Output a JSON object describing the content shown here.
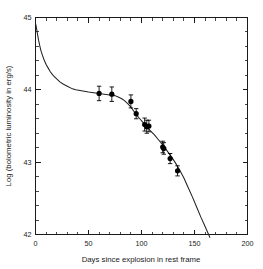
{
  "chart_data": {
    "type": "scatter",
    "title": "",
    "xlabel": "Days since explosion in rest frame",
    "ylabel": "Log (bolometric luminosity in erg/s)",
    "xlim": [
      0,
      200
    ],
    "ylim": [
      42,
      45
    ],
    "xticks": [
      0,
      50,
      100,
      150,
      200
    ],
    "yticks": [
      42,
      43,
      44,
      45
    ],
    "xtick_labels": [
      "0",
      "50",
      "100",
      "150",
      "200"
    ],
    "ytick_labels": [
      "42",
      "43",
      "44",
      "45"
    ],
    "x_minor_step": 10,
    "y_minor_step": 0.2,
    "grid": false,
    "legend": null,
    "series": [
      {
        "name": "Observed bolometric luminosity",
        "marker": "filled-circle",
        "color": "#000000",
        "points": [
          {
            "x": 60,
            "y": 43.95,
            "yerr": 0.1
          },
          {
            "x": 72,
            "y": 43.94,
            "yerr": 0.1
          },
          {
            "x": 90,
            "y": 43.84,
            "yerr": 0.09
          },
          {
            "x": 95,
            "y": 43.67,
            "yerr": 0.07
          },
          {
            "x": 103,
            "y": 43.52,
            "yerr": 0.09
          },
          {
            "x": 105,
            "y": 43.49,
            "yerr": 0.09
          },
          {
            "x": 107,
            "y": 43.5,
            "yerr": 0.08
          },
          {
            "x": 120,
            "y": 43.21,
            "yerr": 0.08
          },
          {
            "x": 121,
            "y": 43.19,
            "yerr": 0.08
          },
          {
            "x": 127,
            "y": 43.05,
            "yerr": 0.07
          },
          {
            "x": 134,
            "y": 42.88,
            "yerr": 0.07
          }
        ]
      },
      {
        "name": "Model light curve",
        "marker": "none",
        "color": "#222222",
        "curve": [
          {
            "x": 0.0,
            "y": 44.92
          },
          {
            "x": 0.6,
            "y": 44.88
          },
          {
            "x": 1.2,
            "y": 44.83
          },
          {
            "x": 2.0,
            "y": 44.76
          },
          {
            "x": 3.0,
            "y": 44.68
          },
          {
            "x": 4.0,
            "y": 44.61
          },
          {
            "x": 5.0,
            "y": 44.55
          },
          {
            "x": 6.5,
            "y": 44.48
          },
          {
            "x": 8.0,
            "y": 44.42
          },
          {
            "x": 10.0,
            "y": 44.35
          },
          {
            "x": 12.0,
            "y": 44.3
          },
          {
            "x": 14.0,
            "y": 44.25
          },
          {
            "x": 16.0,
            "y": 44.21
          },
          {
            "x": 18.0,
            "y": 44.18
          },
          {
            "x": 20.0,
            "y": 44.15
          },
          {
            "x": 23.0,
            "y": 44.11
          },
          {
            "x": 26.0,
            "y": 44.08
          },
          {
            "x": 30.0,
            "y": 44.05
          },
          {
            "x": 34.0,
            "y": 44.02
          },
          {
            "x": 38.0,
            "y": 44.0
          },
          {
            "x": 42.0,
            "y": 43.99
          },
          {
            "x": 46.0,
            "y": 43.98
          },
          {
            "x": 50.0,
            "y": 43.97
          },
          {
            "x": 55.0,
            "y": 43.96
          },
          {
            "x": 60.0,
            "y": 43.95
          },
          {
            "x": 65.0,
            "y": 43.94
          },
          {
            "x": 70.0,
            "y": 43.93
          },
          {
            "x": 75.0,
            "y": 43.92
          },
          {
            "x": 78.0,
            "y": 43.9
          },
          {
            "x": 81.0,
            "y": 43.88
          },
          {
            "x": 84.0,
            "y": 43.85
          },
          {
            "x": 87.0,
            "y": 43.81
          },
          {
            "x": 90.0,
            "y": 43.76
          },
          {
            "x": 93.0,
            "y": 43.7
          },
          {
            "x": 96.0,
            "y": 43.64
          },
          {
            "x": 99.0,
            "y": 43.59
          },
          {
            "x": 102.0,
            "y": 43.54
          },
          {
            "x": 105.0,
            "y": 43.49
          },
          {
            "x": 108.0,
            "y": 43.44
          },
          {
            "x": 112.0,
            "y": 43.38
          },
          {
            "x": 116.0,
            "y": 43.31
          },
          {
            "x": 120.0,
            "y": 43.24
          },
          {
            "x": 124.0,
            "y": 43.16
          },
          {
            "x": 128.0,
            "y": 43.08
          },
          {
            "x": 132.0,
            "y": 42.99
          },
          {
            "x": 136.0,
            "y": 42.89
          },
          {
            "x": 140.0,
            "y": 42.78
          },
          {
            "x": 144.0,
            "y": 42.65
          },
          {
            "x": 148.0,
            "y": 42.52
          },
          {
            "x": 152.0,
            "y": 42.38
          },
          {
            "x": 156.0,
            "y": 42.24
          },
          {
            "x": 160.0,
            "y": 42.11
          },
          {
            "x": 163.0,
            "y": 42.01
          },
          {
            "x": 164.5,
            "y": 41.96
          }
        ]
      }
    ]
  },
  "axes": {
    "x_title": "Days since explosion in rest frame",
    "y_title": "Log (bolometric luminosity in erg/s)"
  }
}
